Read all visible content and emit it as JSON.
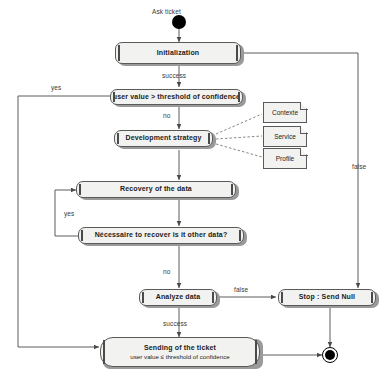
{
  "diagram": {
    "type": "activity-diagram",
    "colors": {
      "node_fill": "#f2f2f0",
      "node_stroke": "#5a5a5a",
      "bar_accent": "#4a4a4a",
      "line": "#4a4a4a",
      "label_text": "#3a3a3a",
      "node_text": "#1c1c1c",
      "terminator": "#000000"
    },
    "start": {
      "label": "Ask ticket",
      "icon": "filled-circle-start-node"
    },
    "end": {
      "icon": "bullseye-end-node"
    },
    "nodes": [
      {
        "id": "initialization",
        "label": "Initialization",
        "shape": "activity"
      },
      {
        "id": "user-value-threshold",
        "label": "user value > threshold of confidence",
        "shape": "activity"
      },
      {
        "id": "development-strategy",
        "label": "Development strategy",
        "shape": "activity"
      },
      {
        "id": "recovery-of-the-data",
        "label": "Recovery of the data",
        "shape": "activity"
      },
      {
        "id": "necessaire-recover",
        "label": "Nécessaire to recover is it other data?",
        "shape": "activity"
      },
      {
        "id": "analyze-data",
        "label": "Analyze data",
        "shape": "activity"
      },
      {
        "id": "stop-send-null",
        "label": "Stop : Send Null",
        "shape": "activity"
      },
      {
        "id": "sending-of-the-ticket",
        "label": "Sending of the ticket",
        "sub": "user value ≤ threshold of confidence",
        "shape": "activity"
      }
    ],
    "notes": [
      {
        "id": "contexte",
        "label": "Contexte"
      },
      {
        "id": "service",
        "label": "Service"
      },
      {
        "id": "profile",
        "label": "Profile"
      }
    ],
    "edge_labels": [
      {
        "id": "success-after-init",
        "text": "success"
      },
      {
        "id": "yes-threshold",
        "text": "yes"
      },
      {
        "id": "no-threshold",
        "text": "no"
      },
      {
        "id": "yes-recover",
        "text": "yes"
      },
      {
        "id": "no-recover",
        "text": "no"
      },
      {
        "id": "false-analyze",
        "text": "false"
      },
      {
        "id": "false-stop-return",
        "text": "false"
      },
      {
        "id": "success-analyze",
        "text": "success"
      }
    ]
  }
}
